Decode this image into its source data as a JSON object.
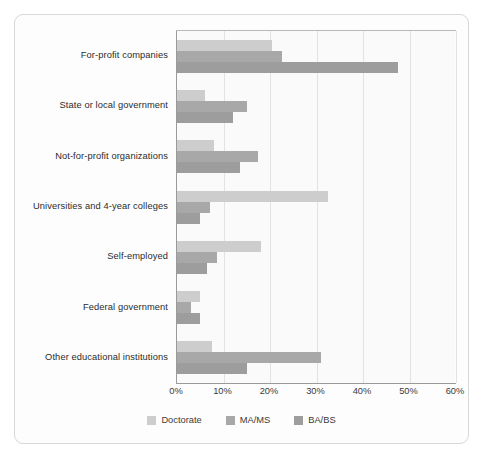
{
  "chart_data": {
    "type": "bar",
    "orientation": "horizontal",
    "title": "",
    "subtitle": "",
    "xlabel": "",
    "ylabel": "",
    "xlim": [
      0,
      60
    ],
    "xtick_labels": [
      "0%",
      "10%",
      "20%",
      "30%",
      "40%",
      "50%",
      "60%"
    ],
    "xtick_values": [
      0,
      10,
      20,
      30,
      40,
      50,
      60
    ],
    "grid": true,
    "legend_position": "bottom",
    "categories": [
      "For-profit companies",
      "State or local government",
      "Not-for-profit organizations",
      "Universities and 4-year colleges",
      "Self-employed",
      "Federal government",
      "Other educational institutions"
    ],
    "series": [
      {
        "name": "Doctorate",
        "color": "#cdcdcd",
        "values": [
          20.5,
          6.0,
          8.0,
          32.5,
          18.0,
          5.0,
          7.5
        ]
      },
      {
        "name": "MA/MS",
        "color": "#a8a8a8",
        "values": [
          22.5,
          15.0,
          17.5,
          7.0,
          8.5,
          3.0,
          31.0
        ]
      },
      {
        "name": "BA/BS",
        "color": "#9d9d9d",
        "values": [
          47.5,
          12.0,
          13.5,
          5.0,
          6.5,
          5.0,
          15.0
        ]
      }
    ]
  },
  "colors": {
    "card_background": "#fdfdfd",
    "card_border": "#d8d8d8",
    "plot_background": "#fafafa",
    "gridline": "#e2e2e2",
    "axis": "#9a9a9a",
    "text": "#2b2b2b"
  }
}
